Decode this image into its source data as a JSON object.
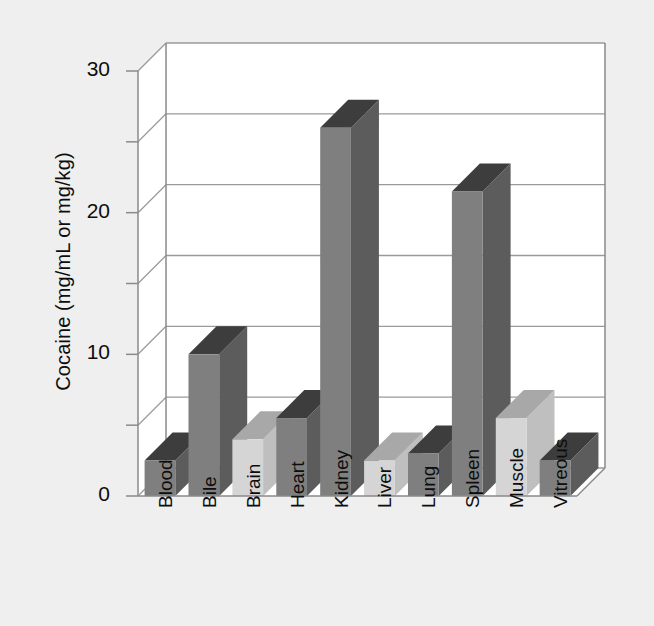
{
  "chart_data": {
    "type": "bar",
    "title": "",
    "subtitle": "",
    "xlabel": "",
    "ylabel": "Cocaine (mg/mL or mg/kg)",
    "categories": [
      "Blood",
      "Bile",
      "Brain",
      "Heart",
      "Kidney",
      "Liver",
      "Lung",
      "Spleen",
      "Muscle",
      "Vitreous"
    ],
    "values": [
      2.5,
      10.0,
      4.0,
      5.5,
      26.0,
      2.5,
      3.0,
      21.5,
      5.5,
      2.5
    ],
    "series": [
      {
        "name": "Cocaine concentration",
        "values": [
          2.5,
          10.0,
          4.0,
          5.5,
          26.0,
          2.5,
          3.0,
          21.5,
          5.5,
          2.5
        ]
      }
    ],
    "bar_shades": [
      "dark",
      "dark",
      "light",
      "dark",
      "dark",
      "light",
      "dark",
      "dark",
      "light",
      "dark"
    ],
    "ylim": [
      0,
      30
    ],
    "ytick_values": [
      0,
      10,
      20,
      30
    ],
    "ytick_labels": [
      "0",
      "10",
      "20",
      "30"
    ],
    "gridline_values": [
      0,
      5,
      10,
      15,
      20,
      25,
      30
    ],
    "grid": true,
    "legend": "none",
    "style": "3d-columns",
    "colors": {
      "background": "#efefef",
      "plot_area": "#ffffff",
      "bar_dark_front": "#7f7f7f",
      "bar_dark_top": "#3d3d3d",
      "bar_dark_side": "#5c5c5c",
      "bar_light_front": "#d5d5d5",
      "bar_light_top": "#a8a8a8",
      "bar_light_side": "#bfbfbf",
      "gridline": "#9a9a9a",
      "axis": "#8a8a8a",
      "text": "#0d0d0d"
    }
  }
}
